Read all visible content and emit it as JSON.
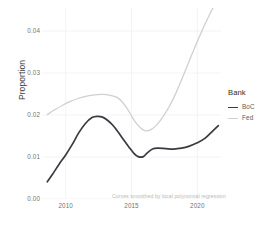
{
  "chart_data": {
    "type": "line",
    "title": "",
    "xlabel": "",
    "ylabel": "Proportion",
    "caption": "Curves smoothed by local polynomial regression",
    "xlim": [
      2008.2,
      2021.8
    ],
    "ylim": [
      0.0,
      0.0455
    ],
    "grid": true,
    "legend": {
      "title": "Bank",
      "position": "right",
      "entries": [
        {
          "name": "BoC",
          "color": "#3a3a42",
          "width": 1.6
        },
        {
          "name": "Fed",
          "color": "#cfcfcf",
          "width": 1.2
        }
      ]
    },
    "x_ticks": [
      2010,
      2015,
      2020
    ],
    "x_tick_labels": [
      "2010",
      "2015",
      "2020"
    ],
    "y_ticks": [
      0.0,
      0.01,
      0.02,
      0.03,
      0.04
    ],
    "y_tick_labels": [
      "0.00",
      "0.01",
      "0.02",
      "0.03",
      "0.04"
    ],
    "series": [
      {
        "name": "BoC",
        "color": "#3a3a42",
        "x": [
          2008.6,
          2009.0,
          2009.5,
          2010.0,
          2010.5,
          2011.0,
          2011.5,
          2012.0,
          2012.4,
          2012.8,
          2013.2,
          2013.6,
          2014.0,
          2014.4,
          2014.8,
          2015.2,
          2015.5,
          2015.9,
          2016.2,
          2016.6,
          2017.0,
          2017.6,
          2018.2,
          2018.8,
          2019.4,
          2020.0,
          2020.6,
          2021.2,
          2021.6
        ],
        "y": [
          0.0041,
          0.0059,
          0.0083,
          0.0105,
          0.013,
          0.0158,
          0.018,
          0.0194,
          0.0197,
          0.0195,
          0.0187,
          0.0175,
          0.0159,
          0.0141,
          0.0124,
          0.0108,
          0.0101,
          0.0101,
          0.011,
          0.0119,
          0.0121,
          0.012,
          0.0119,
          0.0121,
          0.0126,
          0.0134,
          0.0145,
          0.0163,
          0.0175
        ]
      },
      {
        "name": "Fed",
        "color": "#cfcfcf",
        "x": [
          2008.6,
          2009.2,
          2009.8,
          2010.4,
          2011.0,
          2011.6,
          2012.2,
          2012.8,
          2013.4,
          2013.9,
          2014.3,
          2014.7,
          2015.0,
          2015.3,
          2015.7,
          2016.0,
          2016.4,
          2016.9,
          2017.4,
          2017.9,
          2018.4,
          2018.9,
          2019.4,
          2019.9,
          2020.4,
          2020.9,
          2021.3,
          2021.6
        ],
        "y": [
          0.0201,
          0.0213,
          0.0224,
          0.0233,
          0.024,
          0.0245,
          0.0248,
          0.0249,
          0.0247,
          0.0242,
          0.0231,
          0.0214,
          0.0198,
          0.0183,
          0.0169,
          0.0163,
          0.0164,
          0.0176,
          0.0196,
          0.0222,
          0.0254,
          0.0291,
          0.033,
          0.0368,
          0.0404,
          0.0437,
          0.0462,
          0.0476
        ]
      }
    ]
  }
}
